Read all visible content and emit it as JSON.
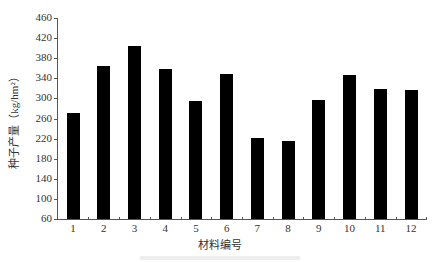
{
  "chart_data": {
    "type": "bar",
    "title": "",
    "xlabel": "材料编号",
    "ylabel": "种子产量（kg/hm²）",
    "categories": [
      "1",
      "2",
      "3",
      "4",
      "5",
      "6",
      "7",
      "8",
      "9",
      "10",
      "11",
      "12"
    ],
    "values": [
      270,
      364,
      404,
      358,
      294,
      348,
      222,
      216,
      296,
      347,
      318,
      317
    ],
    "ylim": [
      60,
      460
    ],
    "yticks": [
      60,
      100,
      140,
      180,
      220,
      260,
      300,
      340,
      380,
      420,
      460
    ],
    "grid": false,
    "legend": null,
    "bar_color": "#000000"
  }
}
